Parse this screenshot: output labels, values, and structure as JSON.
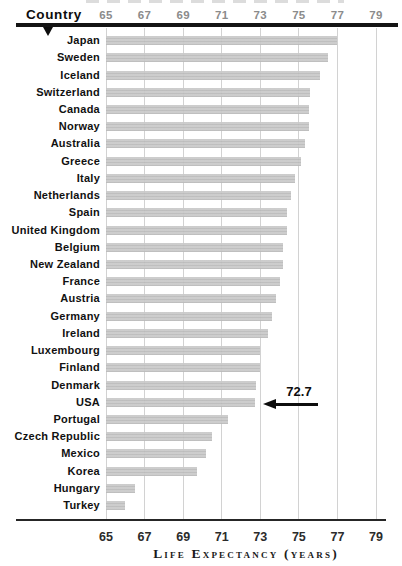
{
  "header": {
    "country_label": "Country"
  },
  "chart_data": {
    "type": "bar",
    "orientation": "horizontal",
    "xlabel": "Life Expectancy (years)",
    "ylabel": "Country",
    "xlim": [
      65,
      79
    ],
    "x_ticks": [
      65,
      67,
      69,
      71,
      73,
      75,
      77,
      79
    ],
    "grid": "vertical",
    "categories": [
      "Japan",
      "Sweden",
      "Iceland",
      "Switzerland",
      "Canada",
      "Norway",
      "Australia",
      "Greece",
      "Italy",
      "Netherlands",
      "Spain",
      "United Kingdom",
      "Belgium",
      "New Zealand",
      "France",
      "Austria",
      "Germany",
      "Ireland",
      "Luxembourg",
      "Finland",
      "Denmark",
      "USA",
      "Portugal",
      "Czech Republic",
      "Mexico",
      "Korea",
      "Hungary",
      "Turkey"
    ],
    "values": [
      77.0,
      76.5,
      76.1,
      75.6,
      75.5,
      75.5,
      75.3,
      75.1,
      74.8,
      74.6,
      74.4,
      74.4,
      74.2,
      74.2,
      74.0,
      73.8,
      73.6,
      73.4,
      73.0,
      73.0,
      72.8,
      72.7,
      71.3,
      70.5,
      70.2,
      69.7,
      66.5,
      66.0
    ],
    "annotation": {
      "text": "72.7",
      "target_country": "USA"
    },
    "colors": {
      "bar": "#c6c6c6",
      "gridline": "#d2d2d2",
      "axis_rule": "#141414",
      "top_tick_labels": "#8b8b8b",
      "bottom_tick_labels": "#2b2b2b"
    }
  }
}
